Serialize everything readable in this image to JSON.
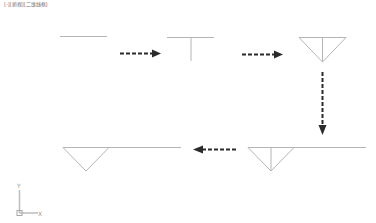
{
  "viewport": {
    "label_parts": [
      "[-]",
      "[俯视]",
      "[二维线框]"
    ],
    "background": "#ffffff"
  },
  "drawing": {
    "line_color": "#b5b5b5",
    "arrow_color": "#2b2b2b",
    "steps": [
      {
        "id": 1,
        "description": "horizontal line"
      },
      {
        "id": 2,
        "description": "line with perpendicular from midpoint"
      },
      {
        "id": 3,
        "description": "inverted triangle with vertical median"
      },
      {
        "id": 4,
        "description": "triangle with median and extended line"
      },
      {
        "id": 5,
        "description": "triangle with extended line, median removed"
      }
    ]
  },
  "ucs": {
    "x_label": "X",
    "y_label": "Y"
  }
}
